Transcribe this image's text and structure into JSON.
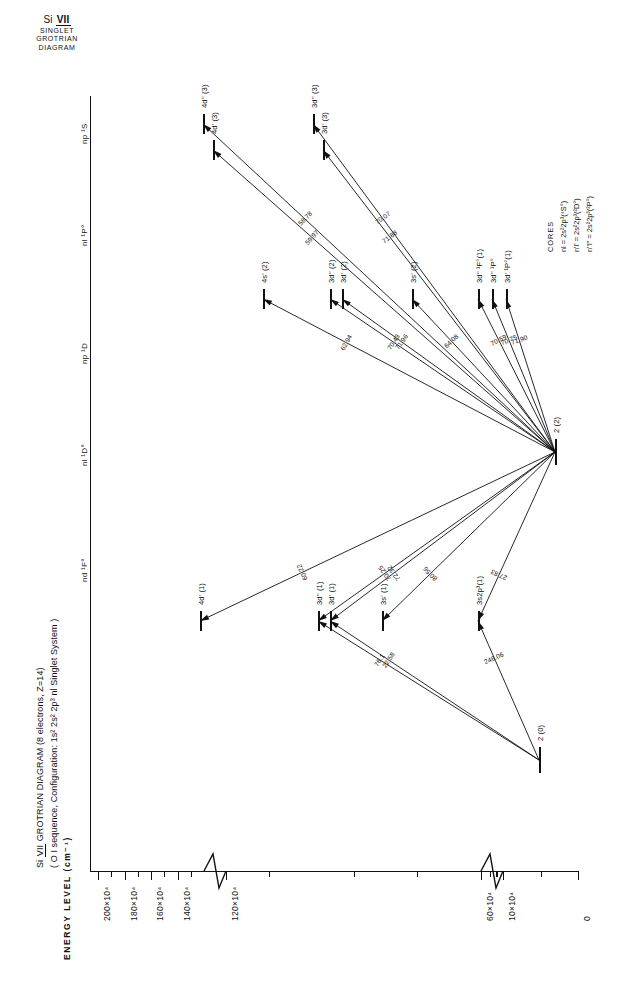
{
  "header": {
    "species": "Si",
    "roman": "VII",
    "line2": "SINGLET",
    "line3": "GROTRIAN",
    "line4": "DIAGRAM"
  },
  "figure_title": {
    "line1_pre": "Si ",
    "line1_roman": "VII",
    "line1_post": " GROTRIAN  DIAGRAM (8 electrons, Z=14)",
    "line2": "( O I sequence, Configuration: 1s² 2s² 2p³ nl  Singlet System )"
  },
  "axis": {
    "title": "ENERGY LEVEL (cm⁻¹)",
    "unit_exponent": "4",
    "tick_labels": [
      "200×10⁴",
      "180×10⁴",
      "160×10⁴",
      "140×10⁴",
      "120×10⁴",
      "60×10⁴",
      "10×10⁴",
      "0"
    ],
    "tick_values": [
      200,
      180,
      160,
      140,
      120,
      60,
      10,
      0
    ],
    "breaks": 2
  },
  "columns": [
    {
      "id": "np1S",
      "label": "np ¹S"
    },
    {
      "id": "nl1Po",
      "label": "nl ¹P°"
    },
    {
      "id": "np1D",
      "label": "np ¹D"
    },
    {
      "id": "nl1Do",
      "label": "nl ¹D°"
    },
    {
      "id": "nd1Fo",
      "label": "nd ¹F°"
    }
  ],
  "cores": {
    "heading": "CORES",
    "items": [
      {
        "sym": "nl",
        "eq": "=",
        "conf": "2s²2p³",
        "term": "(⁴S°)"
      },
      {
        "sym": "n'l'",
        "eq": "=",
        "conf": "2s²2p³",
        "term": "(²D°)"
      },
      {
        "sym": "n''l''",
        "eq": "=",
        "conf": "2s²2p³",
        "term": "(²P°)"
      }
    ]
  },
  "levels": [
    {
      "id": "L1",
      "label": "4d'' (3)",
      "col": "nd1Fo"
    },
    {
      "id": "L2",
      "label": "4d' (3)",
      "col": "nd1Fo"
    },
    {
      "id": "L3",
      "label": "3d'' (3)",
      "col": "nd1Fo"
    },
    {
      "id": "L4",
      "label": "3d' (3)",
      "col": "nd1Fo"
    },
    {
      "id": "L5",
      "label": "4s' (2)",
      "col": "nl1Do"
    },
    {
      "id": "L6",
      "label": "3d'' (2)",
      "col": "nl1Do"
    },
    {
      "id": "L7",
      "label": "3d' (2)",
      "col": "nl1Do"
    },
    {
      "id": "L8",
      "label": "3s' (2)",
      "col": "nl1Do"
    },
    {
      "id": "L9",
      "label": "3d'' ¹F°(1)",
      "col": "nl1Do"
    },
    {
      "id": "L10",
      "label": "3d'' ¹P°",
      "col": "nl1Do"
    },
    {
      "id": "L11",
      "label": "3d' ¹P°(1)",
      "col": "nl1Do"
    },
    {
      "id": "L12",
      "label": "2 (2)",
      "col": "np1D"
    },
    {
      "id": "L13",
      "label": "4d' (1)",
      "col": "nl1Po"
    },
    {
      "id": "L14",
      "label": "3d'' (1)",
      "col": "nl1Po"
    },
    {
      "id": "L15",
      "label": "3d' (1)",
      "col": "nl1Po"
    },
    {
      "id": "L16",
      "label": "3s' (1)",
      "col": "nl1Po"
    },
    {
      "id": "L17",
      "label": "3s2p³(1)",
      "col": "nl1Po"
    },
    {
      "id": "L18",
      "label": "2 (0)",
      "col": "np1S"
    }
  ],
  "transitions": [
    {
      "from": "L1",
      "to": "L12",
      "wavelength": "58.78"
    },
    {
      "from": "L2",
      "to": "L12",
      "wavelength": "59.97"
    },
    {
      "from": "L3",
      "to": "L12",
      "wavelength": "70.07"
    },
    {
      "from": "L4",
      "to": "L12",
      "wavelength": "71.88"
    },
    {
      "from": "L5",
      "to": "L12",
      "wavelength": "62.94"
    },
    {
      "from": "L6",
      "to": "L12",
      "wavelength": "70.43"
    },
    {
      "from": "L7",
      "to": "L12",
      "wavelength": "71.96"
    },
    {
      "from": "L8",
      "to": "L12",
      "wavelength": "64.08"
    },
    {
      "from": "L9",
      "to": "L12",
      "wavelength": "70.59"
    },
    {
      "from": "L10",
      "to": "L12",
      "wavelength": "70.75"
    },
    {
      "from": "L11",
      "to": "L12",
      "wavelength": "71.90"
    },
    {
      "from": "L13",
      "to": "L12",
      "wavelength": "60.22"
    },
    {
      "from": "L14",
      "to": "L12",
      "wavelength": "70.25"
    },
    {
      "from": "L15",
      "to": "L12",
      "wavelength": "72.32"
    },
    {
      "from": "L16",
      "to": "L12",
      "wavelength": "80.56"
    },
    {
      "from": "L17",
      "to": "L12",
      "wavelength": "27.83"
    },
    {
      "from": "L14",
      "to": "L18",
      "wavelength": "76.1"
    },
    {
      "from": "L15",
      "to": "L18",
      "wavelength": "22.58"
    },
    {
      "from": "L17",
      "to": "L18",
      "wavelength": "246.06"
    }
  ]
}
